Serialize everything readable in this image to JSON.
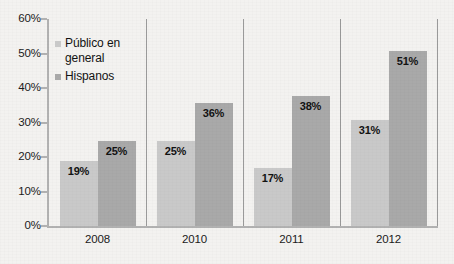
{
  "chart_data": {
    "type": "bar",
    "title": "",
    "subtitle": "",
    "xlabel": "",
    "ylabel": "",
    "categories": [
      "2008",
      "2010",
      "2011",
      "2012"
    ],
    "series": [
      {
        "name": "Público en general",
        "color": "#c9c9c9",
        "values": [
          19,
          25,
          17,
          31
        ],
        "labels": [
          "19%",
          "25%",
          "17%",
          "31%"
        ]
      },
      {
        "name": "Hispanos",
        "color": "#a9a9a9",
        "values": [
          25,
          36,
          38,
          51
        ],
        "labels": [
          "25%",
          "36%",
          "38%",
          "51%"
        ]
      }
    ],
    "ylim": [
      0,
      60
    ],
    "ytick_values": [
      0,
      10,
      20,
      30,
      40,
      50,
      60
    ],
    "ytick_labels": [
      "0%",
      "10%",
      "20%",
      "30%",
      "40%",
      "50%",
      "60%"
    ],
    "grid": false,
    "legend_position": "upper-left-inside",
    "value_label_position": "inside-top",
    "group_separators": true,
    "background_color": "#f3f2f0",
    "axis_color": "#b2b2b2"
  },
  "legend": {
    "items": [
      {
        "label": "Público en general",
        "color": "#c9c9c9"
      },
      {
        "label": "Hispanos",
        "color": "#a9a9a9"
      }
    ]
  }
}
